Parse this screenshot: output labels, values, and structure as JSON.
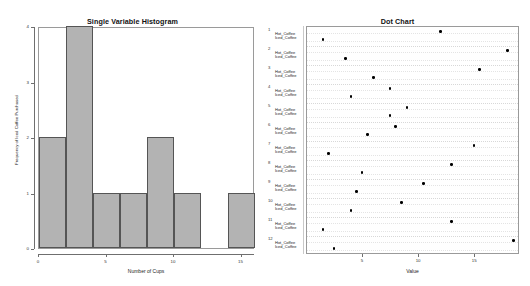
{
  "figure": {
    "panels": [
      {
        "id": "histogram",
        "title": "Single Variable Histogram",
        "xlabel": "Number of Cups",
        "ylabel": "Frequency of Iced Coffee Purchased"
      },
      {
        "id": "dotchart",
        "title": "Dot Chart",
        "xlabel": "Value"
      }
    ]
  },
  "chart_data": [
    {
      "type": "bar",
      "title": "Single Variable Histogram",
      "xlabel": "Number of Cups",
      "ylabel": "Frequency of Iced Coffee Purchased",
      "bin_edges": [
        0,
        2,
        4,
        6,
        8,
        10,
        12,
        14,
        16
      ],
      "categories": [
        "0-2",
        "2-4",
        "4-6",
        "6-8",
        "8-10",
        "10-12",
        "12-14",
        "14-16"
      ],
      "values": [
        2,
        4,
        1,
        1,
        2,
        1,
        0,
        1
      ],
      "xlim": [
        0,
        16
      ],
      "ylim": [
        0,
        4
      ],
      "xticks": [
        0,
        5,
        10,
        15
      ],
      "xticklabels": [
        "0",
        "5",
        "10",
        "15"
      ],
      "yticks": [
        0,
        1,
        2,
        3,
        4
      ],
      "yticklabels": [
        "0",
        "1",
        "2",
        "3",
        "4"
      ],
      "grid": false,
      "bar_color": "#b3b3b3",
      "bar_edge_color": "#555555"
    },
    {
      "type": "scatter",
      "title": "Dot Chart",
      "xlabel": "Value",
      "ylabel": "",
      "xlim": [
        0,
        19
      ],
      "xticks": [
        5,
        10,
        15
      ],
      "xticklabels": [
        "5",
        "10",
        "15"
      ],
      "grid": true,
      "legend_position": "none",
      "marker_color": "#000000",
      "group_numbers": [
        "1",
        "2",
        "3",
        "4",
        "5",
        "6",
        "7",
        "8",
        "9",
        "10",
        "11",
        "12"
      ],
      "row_labels": [
        "Hot_Coffee",
        "Iced_Coffee"
      ],
      "series": [
        {
          "name": "Hot_Coffee",
          "values": [
            12.0,
            18.0,
            15.5,
            7.5,
            9.0,
            8.0,
            15.0,
            13.0,
            10.5,
            8.5,
            13.0,
            18.5
          ]
        },
        {
          "name": "Iced_Coffee",
          "values": [
            1.5,
            3.5,
            6.0,
            4.0,
            7.5,
            5.5,
            2.0,
            5.0,
            4.5,
            4.0,
            1.5,
            2.5
          ]
        }
      ]
    }
  ]
}
